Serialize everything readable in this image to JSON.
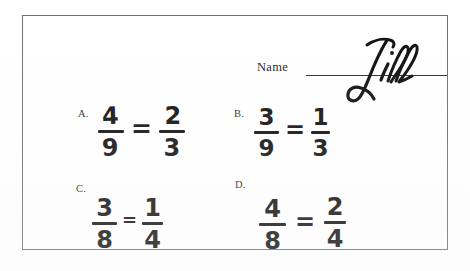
{
  "document": {
    "kind": "scanned-math-worksheet",
    "background_color": "#ffffff",
    "border_color": "#6d6d70",
    "ink_color": "#0d0d0d"
  },
  "name_field": {
    "label": "Name",
    "value": "Jill",
    "value_style": "handwritten-cursive"
  },
  "problems": [
    {
      "label": "A.",
      "left": {
        "numerator": "4",
        "denominator": "9"
      },
      "operator": "=",
      "right": {
        "numerator": "2",
        "denominator": "3"
      }
    },
    {
      "label": "B.",
      "left": {
        "numerator": "3",
        "denominator": "9"
      },
      "operator": "=",
      "right": {
        "numerator": "1",
        "denominator": "3"
      }
    },
    {
      "label": "C.",
      "left": {
        "numerator": "3",
        "denominator": "8"
      },
      "operator": "=",
      "right": {
        "numerator": "1",
        "denominator": "4"
      }
    },
    {
      "label": "D.",
      "left": {
        "numerator": "4",
        "denominator": "8"
      },
      "operator": "=",
      "right": {
        "numerator": "2",
        "denominator": "4"
      }
    }
  ]
}
